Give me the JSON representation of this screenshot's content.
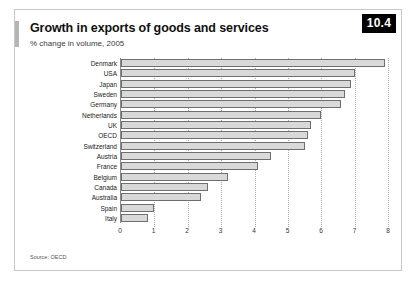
{
  "figure": {
    "badge": "10.4",
    "title": "Growth in exports of goods and services",
    "subtitle": "% change in volume, 2005",
    "source": "Source: OECD"
  },
  "chart_data": {
    "type": "bar",
    "orientation": "horizontal",
    "title": "Growth in exports of goods and services",
    "subtitle": "% change in volume, 2005",
    "xlabel": "",
    "ylabel": "",
    "xlim": [
      0,
      8
    ],
    "xticks": [
      0,
      1,
      2,
      3,
      4,
      5,
      6,
      7,
      8
    ],
    "grid": true,
    "grid_axis": "x",
    "legend": false,
    "bar_fill": "#d9d9d9",
    "bar_border": "#6f6f6f",
    "categories": [
      "Denmark",
      "USA",
      "Japan",
      "Sweden",
      "Germany",
      "Netherlands",
      "UK",
      "OECD",
      "Switzerland",
      "Austria",
      "France",
      "Belgium",
      "Canada",
      "Australia",
      "Spain",
      "Italy"
    ],
    "values": [
      7.9,
      7.0,
      6.9,
      6.7,
      6.6,
      6.0,
      5.7,
      5.6,
      5.5,
      4.5,
      4.1,
      3.2,
      2.6,
      2.4,
      1.0,
      0.8
    ],
    "source": "Source: OECD"
  }
}
